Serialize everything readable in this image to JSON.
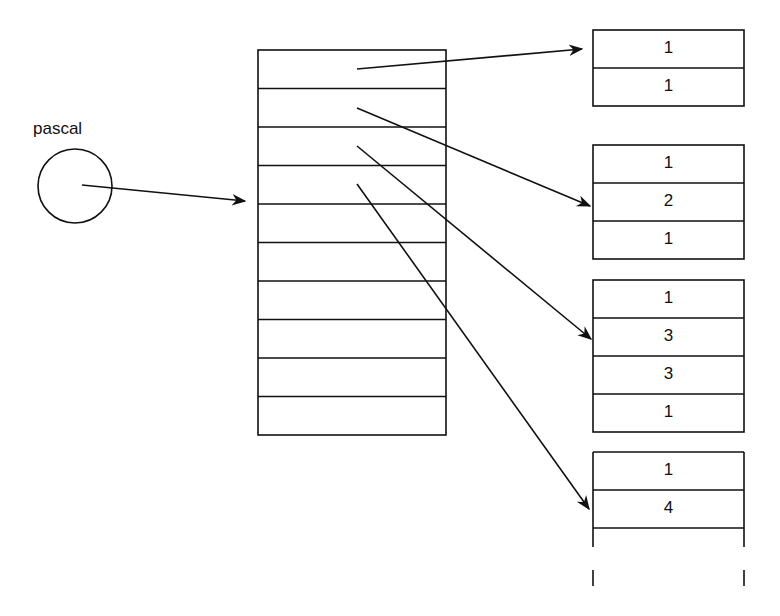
{
  "diagram": {
    "variable_label": "pascal",
    "stroke_color": "#111111",
    "main_array": {
      "row_count": 10
    },
    "rows": [
      {
        "values": [
          "1",
          "1"
        ],
        "truncated": false
      },
      {
        "values": [
          "1",
          "2",
          "1"
        ],
        "truncated": false
      },
      {
        "values": [
          "1",
          "3",
          "3",
          "1"
        ],
        "truncated": false
      },
      {
        "values": [
          "1",
          "4"
        ],
        "truncated": true
      }
    ]
  }
}
